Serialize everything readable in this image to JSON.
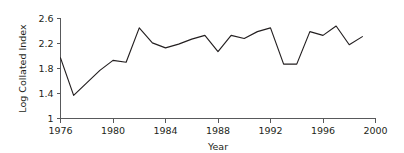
{
  "chart_data": {
    "type": "line",
    "title": "",
    "xlabel": "Year",
    "ylabel": "Log Collated Index",
    "xlim": [
      1976,
      2000
    ],
    "ylim": [
      1,
      2.6
    ],
    "grid": false,
    "legend": "none",
    "x_ticks": [
      "1976",
      "1980",
      "1984",
      "1988",
      "1992",
      "1996",
      "2000"
    ],
    "x_tick_values": [
      1976,
      1980,
      1984,
      1988,
      1992,
      1996,
      2000
    ],
    "y_ticks": [
      "1",
      "1.4",
      "1.8",
      "2.2",
      "2.6"
    ],
    "y_tick_values": [
      1,
      1.4,
      1.8,
      2.2,
      2.6
    ],
    "x": [
      1976,
      1977,
      1978,
      1979,
      1980,
      1981,
      1982,
      1983,
      1984,
      1985,
      1986,
      1987,
      1988,
      1989,
      1990,
      1991,
      1992,
      1993,
      1994,
      1995,
      1996,
      1997,
      1998,
      1999
    ],
    "values": [
      1.97,
      1.37,
      1.57,
      1.77,
      1.93,
      1.9,
      2.45,
      2.21,
      2.13,
      2.19,
      2.27,
      2.33,
      2.07,
      2.33,
      2.28,
      2.39,
      2.45,
      1.87,
      1.87,
      2.39,
      2.33,
      2.48,
      2.18,
      2.31
    ],
    "series": [
      {
        "name": "Log Collated Index",
        "color": "#231f20",
        "values": [
          1.97,
          1.37,
          1.57,
          1.77,
          1.93,
          1.9,
          2.45,
          2.21,
          2.13,
          2.19,
          2.27,
          2.33,
          2.07,
          2.33,
          2.28,
          2.39,
          2.45,
          1.87,
          1.87,
          2.39,
          2.33,
          2.48,
          2.18,
          2.31
        ]
      }
    ],
    "colors": {
      "line": "#231f20",
      "axis": "#58595b",
      "text": "#231f20",
      "background": "#ffffff"
    }
  }
}
